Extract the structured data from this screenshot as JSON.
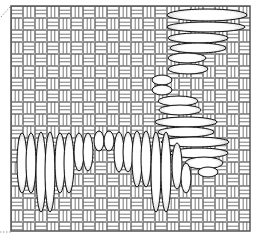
{
  "figure": {
    "width": 257,
    "height": 240,
    "background": "#ffffff",
    "frame": {
      "x": 11,
      "y": 6,
      "w": 239,
      "h": 225,
      "stroke": "#555555"
    },
    "pattern": {
      "type": "basketweave",
      "cell": 24,
      "stroke": "#666666",
      "fill": "#ffffff"
    },
    "corner_marks": [
      {
        "x1": 1,
        "y1": 17,
        "x2": 10,
        "y2": 7
      },
      {
        "x1": 0,
        "y1": 232,
        "x2": 11,
        "y2": 232
      }
    ],
    "ellipse_style": {
      "fill": "#ffffff",
      "stroke": "#111111"
    },
    "vertical_column": [
      {
        "cx": 207,
        "cy": 15,
        "rx": 40,
        "ry": 6
      },
      {
        "cx": 206,
        "cy": 27,
        "rx": 39,
        "ry": 5
      },
      {
        "cx": 198,
        "cy": 38,
        "rx": 30,
        "ry": 5
      },
      {
        "cx": 198,
        "cy": 48,
        "rx": 28,
        "ry": 5
      },
      {
        "cx": 187,
        "cy": 58,
        "rx": 19,
        "ry": 5
      },
      {
        "cx": 188,
        "cy": 69,
        "rx": 20,
        "ry": 5
      },
      {
        "cx": 162,
        "cy": 80,
        "rx": 10,
        "ry": 5
      },
      {
        "cx": 162,
        "cy": 90,
        "rx": 10,
        "ry": 5
      },
      {
        "cx": 178,
        "cy": 101,
        "rx": 20,
        "ry": 5
      },
      {
        "cx": 180,
        "cy": 110,
        "rx": 21,
        "ry": 5
      },
      {
        "cx": 186,
        "cy": 122,
        "rx": 31,
        "ry": 5
      },
      {
        "cx": 186,
        "cy": 132,
        "rx": 28,
        "ry": 5
      },
      {
        "cx": 195,
        "cy": 142,
        "rx": 34,
        "ry": 5
      },
      {
        "cx": 199,
        "cy": 153,
        "rx": 29,
        "ry": 5
      },
      {
        "cx": 204,
        "cy": 163,
        "rx": 19,
        "ry": 6
      },
      {
        "cx": 208,
        "cy": 172,
        "rx": 10,
        "ry": 5
      }
    ],
    "horizontal_row": [
      {
        "cx": 22,
        "cy": 163,
        "rx": 5,
        "ry": 30
      },
      {
        "cx": 31,
        "cy": 163,
        "rx": 5,
        "ry": 30
      },
      {
        "cx": 41,
        "cy": 172,
        "rx": 5,
        "ry": 40
      },
      {
        "cx": 50,
        "cy": 172,
        "rx": 5,
        "ry": 40
      },
      {
        "cx": 60,
        "cy": 163,
        "rx": 5,
        "ry": 30
      },
      {
        "cx": 69,
        "cy": 163,
        "rx": 5,
        "ry": 30
      },
      {
        "cx": 79,
        "cy": 152,
        "rx": 5,
        "ry": 19
      },
      {
        "cx": 88,
        "cy": 152,
        "rx": 5,
        "ry": 19
      },
      {
        "cx": 99,
        "cy": 141,
        "rx": 5,
        "ry": 10
      },
      {
        "cx": 109,
        "cy": 141,
        "rx": 5,
        "ry": 10
      },
      {
        "cx": 119,
        "cy": 152,
        "rx": 5,
        "ry": 20
      },
      {
        "cx": 128,
        "cy": 152,
        "rx": 5,
        "ry": 20
      },
      {
        "cx": 137,
        "cy": 159,
        "rx": 5,
        "ry": 28
      },
      {
        "cx": 146,
        "cy": 159,
        "rx": 5,
        "ry": 28
      },
      {
        "cx": 156,
        "cy": 172,
        "rx": 5,
        "ry": 40
      },
      {
        "cx": 166,
        "cy": 172,
        "rx": 5,
        "ry": 40
      },
      {
        "cx": 177,
        "cy": 166,
        "rx": 5,
        "ry": 23
      },
      {
        "cx": 186,
        "cy": 178,
        "rx": 5,
        "ry": 15
      }
    ]
  }
}
